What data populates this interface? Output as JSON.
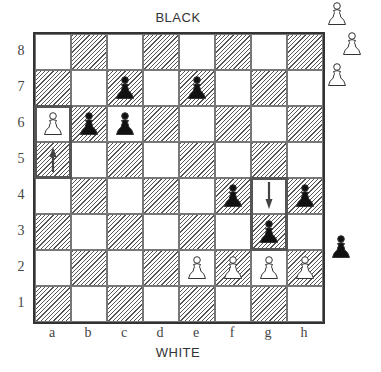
{
  "labels": {
    "top": "BLACK",
    "bottom": "WHITE"
  },
  "files": [
    "a",
    "b",
    "c",
    "d",
    "e",
    "f",
    "g",
    "h"
  ],
  "ranks": [
    "8",
    "7",
    "6",
    "5",
    "4",
    "3",
    "2",
    "1"
  ],
  "pieces": [
    {
      "square": "c7",
      "color": "black",
      "type": "pawn"
    },
    {
      "square": "e7",
      "color": "black",
      "type": "pawn"
    },
    {
      "square": "b6",
      "color": "black",
      "type": "pawn"
    },
    {
      "square": "c6",
      "color": "black",
      "type": "pawn"
    },
    {
      "square": "f4",
      "color": "black",
      "type": "pawn"
    },
    {
      "square": "h4",
      "color": "black",
      "type": "pawn"
    },
    {
      "square": "g3",
      "color": "black",
      "type": "pawn"
    },
    {
      "square": "a6",
      "color": "white",
      "type": "pawn"
    },
    {
      "square": "e2",
      "color": "white",
      "type": "pawn"
    },
    {
      "square": "f2",
      "color": "white",
      "type": "pawn"
    },
    {
      "square": "g2",
      "color": "white",
      "type": "pawn"
    },
    {
      "square": "h2",
      "color": "white",
      "type": "pawn"
    }
  ],
  "moves": [
    {
      "from": "a5",
      "to": "a6",
      "arrow_direction": "up",
      "arrow_square": "a5"
    },
    {
      "from": "g4",
      "to": "g3",
      "arrow_direction": "down",
      "arrow_square": "g4"
    }
  ],
  "captured": {
    "white": [
      "pawn",
      "pawn",
      "pawn"
    ],
    "black": [
      "pawn"
    ]
  },
  "colors": {
    "white_piece": "#ffffff",
    "black_piece": "#111111",
    "outline": "#333333"
  }
}
